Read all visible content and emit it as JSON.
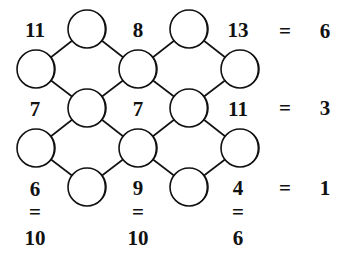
{
  "puzzle": {
    "rows": [
      {
        "left": "11",
        "mid": "8",
        "right": "13",
        "eq": "=",
        "target": "6"
      },
      {
        "left": "7",
        "mid": "7",
        "right": "11",
        "eq": "=",
        "target": "3"
      },
      {
        "left": "6",
        "mid": "9",
        "right": "4",
        "eq": "=",
        "target": "1"
      }
    ],
    "columns": [
      {
        "eq": "=",
        "target": "10"
      },
      {
        "eq": "=",
        "target": "10"
      },
      {
        "eq": "=",
        "target": "6"
      }
    ],
    "circles": [
      {
        "id": "c1",
        "cx": 87,
        "cy": 29
      },
      {
        "id": "c2",
        "cx": 189,
        "cy": 29
      },
      {
        "id": "c3",
        "cx": 36,
        "cy": 69
      },
      {
        "id": "c4",
        "cx": 138,
        "cy": 69
      },
      {
        "id": "c5",
        "cx": 240,
        "cy": 69
      },
      {
        "id": "c6",
        "cx": 87,
        "cy": 108
      },
      {
        "id": "c7",
        "cx": 189,
        "cy": 108
      },
      {
        "id": "c8",
        "cx": 36,
        "cy": 148
      },
      {
        "id": "c9",
        "cx": 138,
        "cy": 148
      },
      {
        "id": "c10",
        "cx": 240,
        "cy": 148
      },
      {
        "id": "c11",
        "cx": 87,
        "cy": 187
      },
      {
        "id": "c12",
        "cx": 189,
        "cy": 187
      }
    ],
    "colors": {
      "ink": "#111111",
      "background": "#ffffff"
    }
  }
}
